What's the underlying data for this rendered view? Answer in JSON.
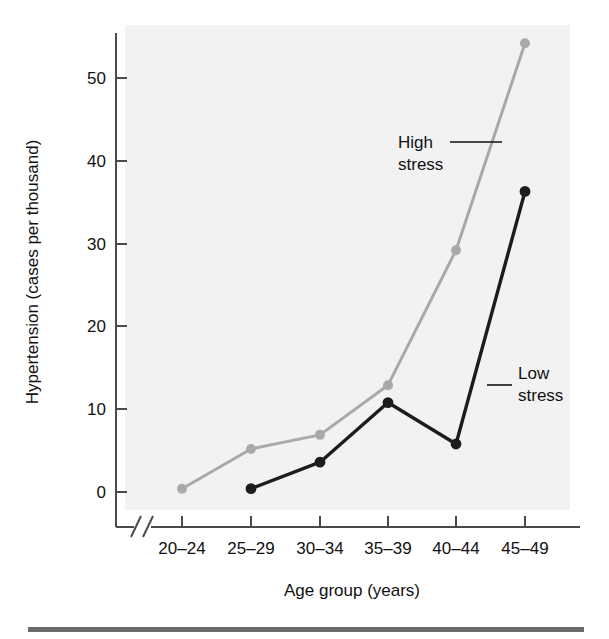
{
  "chart_data": {
    "type": "line",
    "title": "",
    "subtitle": "",
    "xlabel": "Age group (years)",
    "ylabel": "Hypertension (cases per thousand)",
    "categories": [
      "20–24",
      "25–29",
      "30–34",
      "35–39",
      "40–44",
      "45–49"
    ],
    "xtick_labels": [
      "20–24",
      "25–29",
      "30–34",
      "35–39",
      "40–44",
      "45–49"
    ],
    "ytick_labels": [
      "0",
      "10",
      "20",
      "30",
      "40",
      "50"
    ],
    "ytick_values": [
      0,
      10,
      20,
      30,
      40,
      50
    ],
    "ylim": [
      0,
      56
    ],
    "grid": false,
    "legend_position": "inline-annotations",
    "axis_break_x": true,
    "series": [
      {
        "name": "High stress",
        "color": "#a9a9a9",
        "marker": "circle",
        "values": [
          0.4,
          5.2,
          6.9,
          12.9,
          29.2,
          54.2
        ],
        "start_category_index": 0
      },
      {
        "name": "Low stress",
        "color": "#1c1c1c",
        "marker": "circle",
        "values": [
          null,
          0.4,
          3.6,
          10.8,
          5.8,
          36.3
        ],
        "start_category_index": 1
      }
    ],
    "annotations": [
      {
        "name": "high-stress-annotation",
        "line1": "High",
        "line2": "stress",
        "text": "High stress"
      },
      {
        "name": "low-stress-annotation",
        "line1": "Low",
        "line2": "stress",
        "text": "Low stress"
      }
    ]
  },
  "figure": {
    "plot_background_color": "#f2f2f2",
    "page_background_color": "#ffffff",
    "axis_color": "#4a4a4a",
    "rule_color": "#6b6b6b"
  }
}
